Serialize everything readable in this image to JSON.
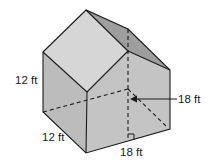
{
  "figure": {
    "type": "pentagonal prism (house shape)",
    "colors": {
      "front_roof": "#d6d6d6",
      "side_roof": "#9e9e9e",
      "front_wall": "#bcbcbc",
      "side_wall": "#c2c2c2",
      "edge": "#1a1a1a"
    }
  },
  "labels": {
    "left_height": "12 ft",
    "depth": "12 ft",
    "width": "18 ft",
    "total_height": "18 ft"
  }
}
